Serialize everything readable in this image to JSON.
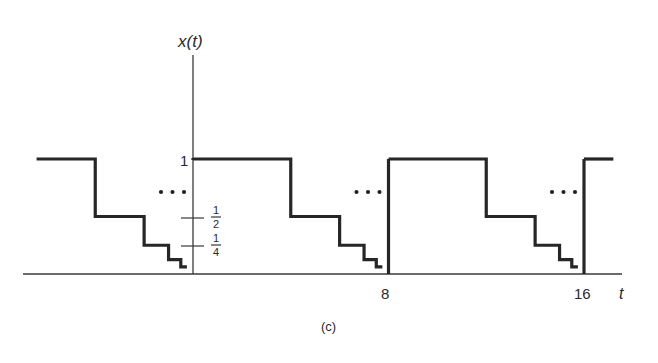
{
  "figure": {
    "caption": "(c)",
    "y_axis_label": "x(t)",
    "x_axis_label": "t",
    "x_tick_labels": [
      "8",
      "16"
    ],
    "y_tick_labels": {
      "one": "1",
      "half_num": "1",
      "half_den": "2",
      "quarter_num": "1",
      "quarter_den": "4"
    },
    "ellipsis": "..."
  },
  "chart_data": {
    "type": "line",
    "title": "",
    "xlabel": "t",
    "ylabel": "x(t)",
    "period": 8,
    "xlim": [
      -6.4,
      17.2
    ],
    "ylim": [
      0,
      1
    ],
    "x_ticks": [
      8,
      16
    ],
    "y_ticks": [
      1,
      0.5,
      0.25
    ],
    "series": [
      {
        "name": "x(t)",
        "description": "Periodic staircase: 1 on [0,4), 1/2 on [4,6), 1/4 on [6,7), 1/8 on [7,7.5), 1/16 on [7.5,7.75), ... repeating every 8",
        "period_segments": [
          {
            "t_start": 0,
            "t_end": 4,
            "value": 1
          },
          {
            "t_start": 4,
            "t_end": 6,
            "value": 0.5
          },
          {
            "t_start": 6,
            "t_end": 7,
            "value": 0.25
          },
          {
            "t_start": 7,
            "t_end": 7.5,
            "value": 0.125
          },
          {
            "t_start": 7.5,
            "t_end": 7.75,
            "value": 0.0625
          }
        ]
      }
    ],
    "annotations": [
      "...",
      "...",
      "..."
    ],
    "grid": false,
    "legend": "none"
  }
}
